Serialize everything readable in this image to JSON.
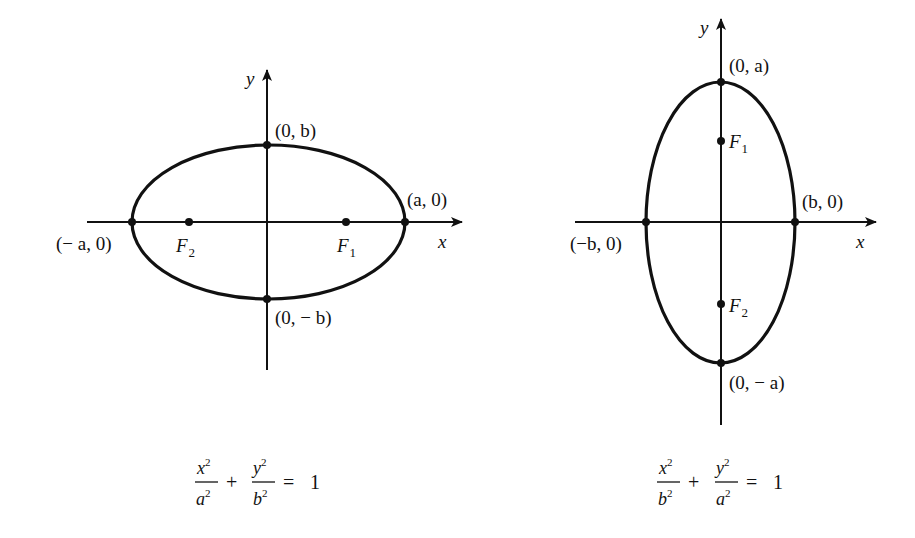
{
  "diagrams": [
    {
      "id": "horizontal-ellipse",
      "axes": {
        "x_label": "x",
        "y_label": "y"
      },
      "vertices": {
        "top": "(0, b)",
        "bottom": "(0, − b)",
        "left": "(− a, 0)",
        "right": "(a, 0)"
      },
      "foci": [
        {
          "name": "F",
          "sub": "1"
        },
        {
          "name": "F",
          "sub": "2"
        }
      ],
      "equation": {
        "term1_num": "x",
        "term1_den": "a",
        "term2_num": "y",
        "term2_den": "b",
        "exp": "2",
        "plus": "+",
        "equals": "=",
        "rhs": "1"
      }
    },
    {
      "id": "vertical-ellipse",
      "axes": {
        "x_label": "x",
        "y_label": "y"
      },
      "vertices": {
        "top": "(0, a)",
        "bottom": "(0, − a)",
        "left": "(−b, 0)",
        "right": "(b, 0)"
      },
      "foci": [
        {
          "name": "F",
          "sub": "1"
        },
        {
          "name": "F",
          "sub": "2"
        }
      ],
      "equation": {
        "term1_num": "x",
        "term1_den": "b",
        "term2_num": "y",
        "term2_den": "a",
        "exp": "2",
        "plus": "+",
        "equals": "=",
        "rhs": "1"
      }
    }
  ],
  "colors": {
    "ink": "#111111",
    "background": "#ffffff"
  }
}
